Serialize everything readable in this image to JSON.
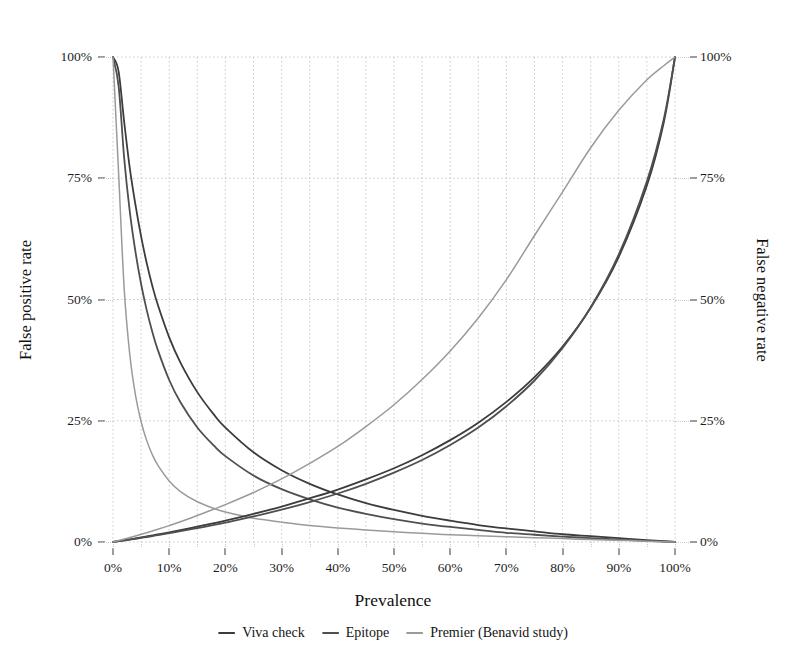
{
  "chart_data": {
    "type": "line",
    "title": "",
    "xlabel": "Prevalence",
    "ylabel": "False positive rate",
    "y2label": "False negative rate",
    "xlim": [
      0,
      100
    ],
    "ylim": [
      0,
      100
    ],
    "y2lim": [
      0,
      100
    ],
    "grid": true,
    "grid_major_x": [
      0,
      10,
      20,
      30,
      40,
      50,
      60,
      70,
      80,
      90,
      100
    ],
    "grid_minor_x": [
      5,
      15,
      25,
      35,
      45,
      55,
      65,
      75,
      85,
      95
    ],
    "grid_major_y": [
      0,
      25,
      50,
      75,
      100
    ],
    "xticks": [
      "0%",
      "10%",
      "20%",
      "30%",
      "40%",
      "50%",
      "60%",
      "70%",
      "80%",
      "90%",
      "100%"
    ],
    "xtick_values": [
      0,
      10,
      20,
      30,
      40,
      50,
      60,
      70,
      80,
      90,
      100
    ],
    "yticks": [
      "0%",
      "25%",
      "50%",
      "75%",
      "100%"
    ],
    "ytick_values": [
      0,
      25,
      50,
      75,
      100
    ],
    "y2ticks": [
      "0%",
      "25%",
      "50%",
      "75%",
      "100%"
    ],
    "y2tick_values": [
      0,
      25,
      50,
      75,
      100
    ],
    "legend_position": "bottom",
    "x": [
      0,
      1,
      2,
      3,
      4,
      5,
      6,
      7,
      8,
      10,
      12,
      15,
      18,
      20,
      25,
      30,
      35,
      40,
      45,
      50,
      55,
      60,
      65,
      70,
      75,
      80,
      85,
      90,
      95,
      98,
      100
    ],
    "series": [
      {
        "name": "Viva check",
        "axis": "left",
        "metric": "false positive rate",
        "color": "#3c3c3c",
        "values": [
          100,
          97.0,
          86.5,
          77.0,
          69.5,
          63.0,
          57.5,
          52.8,
          48.8,
          42.2,
          37.0,
          30.9,
          26.2,
          23.6,
          18.5,
          14.8,
          12.0,
          9.8,
          8.0,
          6.6,
          5.4,
          4.4,
          3.5,
          2.8,
          2.2,
          1.6,
          1.2,
          0.8,
          0.4,
          0.15,
          0
        ]
      },
      {
        "name": "Epitope",
        "axis": "left",
        "metric": "false positive rate",
        "color": "#4f4f4f",
        "values": [
          100,
          94.0,
          79.0,
          68.0,
          59.8,
          53.2,
          47.8,
          43.3,
          39.5,
          33.4,
          28.8,
          23.6,
          19.8,
          17.7,
          13.7,
          10.9,
          8.8,
          7.1,
          5.8,
          4.7,
          3.8,
          3.1,
          2.5,
          1.9,
          1.5,
          1.1,
          0.8,
          0.5,
          0.25,
          0.1,
          0
        ]
      },
      {
        "name": "Premier (Benavid study)",
        "axis": "left",
        "metric": "false positive rate",
        "color": "#9a9a9a",
        "values": [
          100,
          76.0,
          52.0,
          38.5,
          30.3,
          24.8,
          20.9,
          18.0,
          15.8,
          12.6,
          10.4,
          8.3,
          6.9,
          6.2,
          4.9,
          4.1,
          3.4,
          2.9,
          2.5,
          2.1,
          1.8,
          1.5,
          1.3,
          1.1,
          0.9,
          0.7,
          0.5,
          0.35,
          0.18,
          0.07,
          0
        ]
      },
      {
        "name": "Viva check",
        "axis": "right",
        "metric": "false negative rate",
        "color": "#3c3c3c",
        "values": [
          0,
          0.18,
          0.36,
          0.55,
          0.74,
          0.94,
          1.14,
          1.35,
          1.56,
          2.0,
          2.45,
          3.16,
          3.9,
          4.4,
          5.8,
          7.3,
          9.0,
          10.8,
          12.9,
          15.2,
          17.9,
          21.0,
          24.6,
          28.9,
          34.0,
          40.3,
          48.3,
          58.8,
          73.5,
          86.5,
          100
        ]
      },
      {
        "name": "Epitope",
        "axis": "right",
        "metric": "false negative rate",
        "color": "#4f4f4f",
        "values": [
          0,
          0.16,
          0.33,
          0.5,
          0.67,
          0.85,
          1.03,
          1.22,
          1.41,
          1.81,
          2.22,
          2.86,
          3.53,
          4.0,
          5.26,
          6.67,
          8.24,
          10.0,
          12.0,
          14.3,
          16.9,
          20.0,
          23.6,
          28.0,
          33.3,
          40.0,
          48.4,
          59.3,
          74.4,
          87.2,
          100
        ]
      },
      {
        "name": "Premier (Benavid study)",
        "axis": "right",
        "metric": "false negative rate",
        "color": "#9a9a9a",
        "values": [
          0,
          0.3,
          0.61,
          0.93,
          1.25,
          1.58,
          1.92,
          2.27,
          2.63,
          3.38,
          4.17,
          5.45,
          6.8,
          7.7,
          10.2,
          13.0,
          16.2,
          19.7,
          23.8,
          28.3,
          33.5,
          39.4,
          46.2,
          54.1,
          63.2,
          72.2,
          81.3,
          89.0,
          95.3,
          98.2,
          100
        ]
      }
    ],
    "legend": [
      {
        "label": "Viva check",
        "color": "#3c3c3c"
      },
      {
        "label": "Epitope",
        "color": "#4f4f4f"
      },
      {
        "label": "Premier (Benavid study)",
        "color": "#9a9a9a"
      }
    ]
  },
  "style": {
    "grid_color": "#c9c9c9",
    "background": "#ffffff",
    "text_color": "#1a1a1a"
  }
}
